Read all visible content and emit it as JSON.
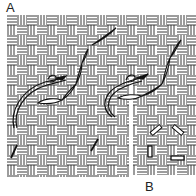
{
  "figure": {
    "type": "embroidery-stitch-diagram",
    "panel_a_label": "A",
    "panel_b_label": "B",
    "canvas": {
      "pattern": "basketweave",
      "line_color": "#222222",
      "background": "#ffffff"
    },
    "panel_a": {
      "elements": [
        "thread-loop-left",
        "stitch-diagonal-left",
        "thread-loop-right",
        "stitch-diagonal-right",
        "small-stitch-bottom-left",
        "small-stitch-bottom-middle"
      ]
    },
    "panel_b": {
      "elements": [
        "stitch-mark-upper-left",
        "stitch-mark-upper-right",
        "stitch-mark-vertical",
        "stitch-mark-horizontal"
      ]
    }
  }
}
